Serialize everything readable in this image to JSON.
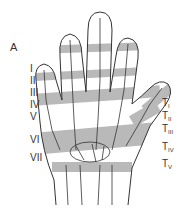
{
  "figure": {
    "panel_label": "A",
    "zone_fill": "#b9b9b9",
    "outline": "#333333",
    "finger_zones": [
      {
        "label": "I",
        "y": 68
      },
      {
        "label": "II",
        "y": 80
      },
      {
        "label": "III",
        "y": 92
      },
      {
        "label": "IV",
        "y": 104
      },
      {
        "label": "V",
        "y": 116
      },
      {
        "label": "VI",
        "y": 137
      },
      {
        "label": "VII",
        "y": 155
      }
    ],
    "thumb_zones": [
      {
        "label": "T",
        "sub": "I",
        "y": 104
      },
      {
        "label": "T",
        "sub": "II",
        "y": 117
      },
      {
        "label": "T",
        "sub": "III",
        "y": 130
      },
      {
        "label": "T",
        "sub": "IV",
        "y": 148
      },
      {
        "label": "T",
        "sub": "V",
        "y": 165
      }
    ]
  }
}
